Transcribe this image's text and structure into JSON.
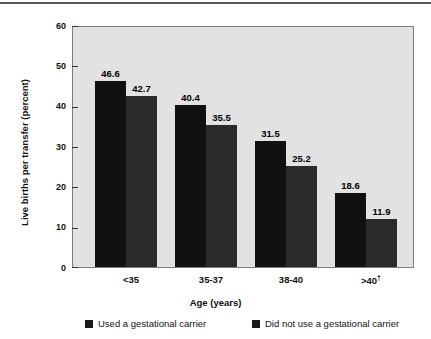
{
  "chart_data": {
    "type": "bar",
    "title": "",
    "xlabel": "Age (years)",
    "ylabel": "Live births per transfer (percent)",
    "categories": [
      "<35",
      "35–37",
      "38–40",
      ">40†"
    ],
    "category_plain": [
      "<35",
      "35-37",
      "38-40",
      ">40"
    ],
    "category_dagger": [
      false,
      false,
      false,
      true
    ],
    "series": [
      {
        "name": "Used a gestational carrier",
        "values": [
          46.6,
          40.4,
          31.5,
          18.6
        ],
        "color": "#111111"
      },
      {
        "name": "Did not use a gestational carrier",
        "values": [
          42.7,
          35.5,
          25.2,
          11.9
        ],
        "color": "#2b2b2b"
      }
    ],
    "ylim": [
      0,
      60
    ],
    "yticks": [
      0,
      10,
      20,
      30,
      40,
      50,
      60
    ],
    "ytick_labels": [
      "0",
      "10",
      "20",
      "30",
      "40",
      "50",
      "60"
    ],
    "grid": false,
    "legend_position": "bottom",
    "plot_background": "#e2e2e2",
    "figure_background": "#ffffff"
  },
  "axis": {
    "y_label": "Live births per transfer (percent)",
    "x_label": "Age (years)"
  },
  "legend": {
    "items": [
      {
        "label": "Used a gestational carrier",
        "color": "#1b1b1b"
      },
      {
        "label": "Did not use a gestational carrier",
        "color": "#1b1b1b"
      }
    ]
  }
}
